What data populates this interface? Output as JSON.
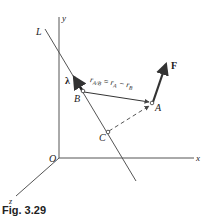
{
  "figure": {
    "caption": "Fig. 3.29",
    "axes": {
      "x": "x",
      "y": "y",
      "z": "z",
      "origin": "O"
    },
    "line_label": "L",
    "points": {
      "A": "A",
      "B": "B",
      "C": "C"
    },
    "unit_vector_label": "λ",
    "force_label": "F",
    "position_vector": {
      "lhs": "r",
      "lhs_sub": "A/B",
      "eq": " = ",
      "r1": "r",
      "r1_sub": "A",
      "minus": " − ",
      "r2": "r",
      "r2_sub": "B"
    },
    "colors": {
      "line": "#555555",
      "arrow": "#333333",
      "text": "#222222"
    }
  }
}
